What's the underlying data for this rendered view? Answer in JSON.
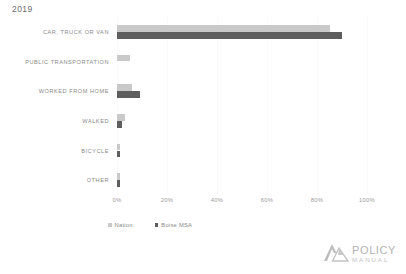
{
  "chart_data": {
    "type": "bar",
    "orientation": "horizontal",
    "title": "2019",
    "xlabel": "",
    "ylabel": "",
    "xlim": [
      0,
      100
    ],
    "xticks": [
      "0%",
      "20%",
      "40%",
      "60%",
      "80%",
      "100%"
    ],
    "xtick_values": [
      0,
      20,
      40,
      60,
      80,
      100
    ],
    "grid": true,
    "legend_position": "bottom-left",
    "categories": [
      "CAR, TRUCK OR VAN",
      "PUBLIC TRANSPORTATION",
      "WORKED FROM HOME",
      "WALKED",
      "BICYCLE",
      "OTHER"
    ],
    "series": [
      {
        "name": "Nation",
        "color": "#c9c9c9",
        "values": [
          85,
          5,
          6,
          3,
          1,
          1
        ]
      },
      {
        "name": "Boise MSA",
        "color": "#5e5e5e",
        "values": [
          90,
          0,
          9,
          2,
          1,
          1
        ]
      }
    ]
  },
  "legend": {
    "items": [
      {
        "label": "Nation",
        "marker": "square-light"
      },
      {
        "label": "Boise MSA",
        "marker": "square-dark"
      }
    ]
  },
  "logo": {
    "mark": "mountain-logo-icon",
    "line1": "POLICY",
    "line2": "MANUAL"
  }
}
